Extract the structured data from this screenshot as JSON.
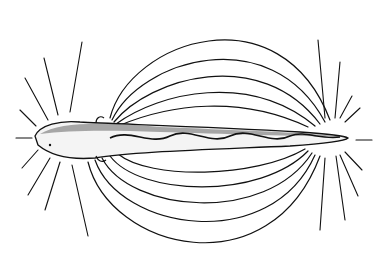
{
  "figure": {
    "background_color": "#ffffff",
    "line_color": "#111111",
    "fish": {
      "orientation": "head-left",
      "features": [
        "dorsal-stipple",
        "wavy-lateral-band",
        "pectoral-fin-top",
        "pectoral-fin-bottom",
        "eye"
      ]
    },
    "field_lines": {
      "upper_arcs": 5,
      "lower_arcs": 5,
      "head_rays": 8,
      "tail_rays": 8
    }
  }
}
